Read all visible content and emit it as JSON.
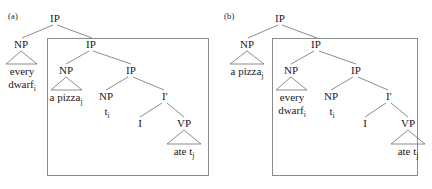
{
  "figure": {
    "background_color": "#ffffff",
    "line_color": "#6e6e6e",
    "box_border_color": "#8a8a8a",
    "text_color": "#1a1a1a"
  },
  "panels": [
    {
      "label": "(a)",
      "nodes": {
        "root_ip": "IP",
        "outer_np": "NP",
        "boxed_ip": "IP",
        "inner_np": "NP",
        "inner_ip": "IP",
        "trace_np": "NP",
        "i_bar": "I′",
        "i_head": "I",
        "vp": "VP"
      },
      "leaves": {
        "outer_np_line1": "every",
        "outer_np_line2": "dwarf",
        "outer_np_sub": "i",
        "inner_np_text": "a pizza",
        "inner_np_sub": "j",
        "trace_text": "t",
        "trace_sub": "i",
        "vp_text": "ate t",
        "vp_sub": "j"
      }
    },
    {
      "label": "(b)",
      "nodes": {
        "root_ip": "IP",
        "outer_np": "NP",
        "boxed_ip": "IP",
        "inner_np": "NP",
        "inner_ip": "IP",
        "trace_np": "NP",
        "i_bar": "I′",
        "i_head": "I",
        "vp": "VP"
      },
      "leaves": {
        "outer_np_line1": "a pizza",
        "outer_np_line2": "",
        "outer_np_sub": "j",
        "inner_np_line1": "every",
        "inner_np_line2": "dwarf",
        "inner_np_sub": "i",
        "trace_text": "t",
        "trace_sub": "i",
        "vp_text": "ate t",
        "vp_sub": "j"
      }
    }
  ]
}
